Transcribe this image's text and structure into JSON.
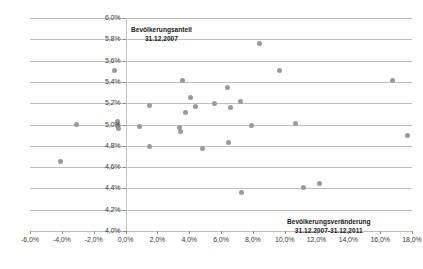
{
  "chart_data": {
    "type": "scatter",
    "title": "",
    "xlabel": "Bevölkerungsveränderung 31.12.2007-31.12.2011",
    "ylabel": "Bevölkerungsanteil 31.12.2007",
    "xlim": [
      -6.0,
      18.0
    ],
    "ylim": [
      4.0,
      6.0
    ],
    "xticks": [
      "-6,0%",
      "-4,0%",
      "-2,0%",
      "0,0%",
      "2,0%",
      "4,0%",
      "6,0%",
      "8,0%",
      "10,0%",
      "12,0%",
      "14,0%",
      "16,0%",
      "18,0%"
    ],
    "xtick_values": [
      -6.0,
      -4.0,
      -2.0,
      0.0,
      2.0,
      4.0,
      6.0,
      8.0,
      10.0,
      12.0,
      14.0,
      16.0,
      18.0
    ],
    "yticks": [
      "4,0%",
      "4,2%",
      "4,4%",
      "4,6%",
      "4,8%",
      "5,0%",
      "5,2%",
      "5,4%",
      "5,6%",
      "5,8%",
      "6,0%"
    ],
    "ytick_values": [
      4.0,
      4.2,
      4.4,
      4.6,
      4.8,
      5.0,
      5.2,
      5.4,
      5.6,
      5.8,
      6.0
    ],
    "grid": "horizontal",
    "legend": "none",
    "marker_color": "#9a9a9a",
    "gridline_color": "#bfbfbf",
    "points": [
      {
        "x": -4.1,
        "y": 4.65
      },
      {
        "x": -3.1,
        "y": 5.0
      },
      {
        "x": -0.7,
        "y": 5.51
      },
      {
        "x": -0.5,
        "y": 5.03
      },
      {
        "x": -0.5,
        "y": 4.99
      },
      {
        "x": -0.45,
        "y": 4.96
      },
      {
        "x": 0.9,
        "y": 4.98
      },
      {
        "x": 1.5,
        "y": 5.18
      },
      {
        "x": 1.5,
        "y": 4.79
      },
      {
        "x": 3.4,
        "y": 4.97
      },
      {
        "x": 3.45,
        "y": 4.93
      },
      {
        "x": 3.6,
        "y": 5.41
      },
      {
        "x": 3.75,
        "y": 5.11
      },
      {
        "x": 4.1,
        "y": 5.25
      },
      {
        "x": 4.4,
        "y": 5.17
      },
      {
        "x": 4.85,
        "y": 4.77
      },
      {
        "x": 5.6,
        "y": 5.2
      },
      {
        "x": 6.4,
        "y": 5.35
      },
      {
        "x": 6.5,
        "y": 4.83
      },
      {
        "x": 6.6,
        "y": 5.16
      },
      {
        "x": 7.2,
        "y": 5.22
      },
      {
        "x": 7.3,
        "y": 4.36
      },
      {
        "x": 7.9,
        "y": 4.99
      },
      {
        "x": 8.4,
        "y": 5.76
      },
      {
        "x": 9.7,
        "y": 5.51
      },
      {
        "x": 10.7,
        "y": 5.01
      },
      {
        "x": 11.2,
        "y": 4.41
      },
      {
        "x": 12.2,
        "y": 4.45
      },
      {
        "x": 16.8,
        "y": 5.41
      },
      {
        "x": 17.7,
        "y": 4.9
      }
    ]
  }
}
